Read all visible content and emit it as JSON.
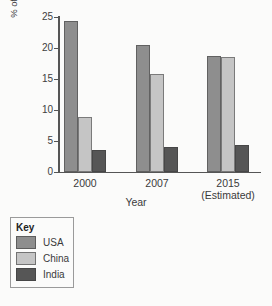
{
  "chart_data": {
    "type": "bar",
    "title": "",
    "xlabel": "Year",
    "ylabel": "% of world total energy consumption",
    "ylabel_line1": "% of world total energy",
    "ylabel_line2": "consumption",
    "categories": [
      "2000",
      "2007",
      "2015"
    ],
    "category_sublabels": [
      "",
      "",
      "(Estimated)"
    ],
    "series": [
      {
        "name": "USA",
        "color": "#8e8e8e",
        "values": [
          24.3,
          20.5,
          18.7
        ]
      },
      {
        "name": "China",
        "color": "#c5c5c5",
        "values": [
          8.9,
          15.8,
          18.5
        ]
      },
      {
        "name": "India",
        "color": "#565656",
        "values": [
          3.6,
          4.1,
          4.4
        ]
      }
    ],
    "ylim": [
      0,
      25
    ],
    "yticks": [
      "0",
      "5",
      "10",
      "15",
      "20",
      "25"
    ],
    "grid": false,
    "legend_position": "below-left"
  },
  "legend": {
    "title": "Key",
    "entries": [
      {
        "label": "USA"
      },
      {
        "label": "China"
      },
      {
        "label": "India"
      }
    ]
  }
}
